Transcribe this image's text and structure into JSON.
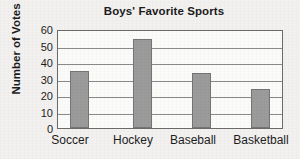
{
  "chart_data": {
    "type": "bar",
    "title": "Boys' Favorite Sports",
    "xlabel": "",
    "ylabel": "Number of Votes",
    "categories": [
      "Soccer",
      "Hockey",
      "Baseball",
      "Basketball"
    ],
    "values": [
      35,
      55,
      34,
      24
    ],
    "ylim": [
      0,
      60
    ],
    "ytick_labels": [
      "0",
      "10",
      "20",
      "30",
      "40",
      "50",
      "60"
    ],
    "yticks": [
      0,
      10,
      20,
      30,
      40,
      50,
      60
    ],
    "grid": true,
    "legend": null,
    "colors": {
      "bar_fill": "#9b9b9b",
      "bar_edge": "#757575",
      "grid": "#8a8a8a",
      "frame": "#6b6b6b",
      "text": "#1c1c1c",
      "background": "#f2f1f0",
      "plot_background": "#fbfbfa"
    }
  }
}
